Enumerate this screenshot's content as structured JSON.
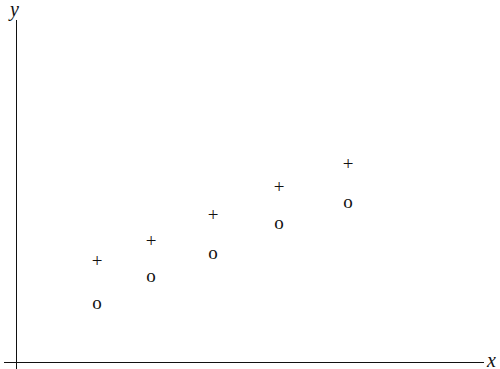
{
  "axes": {
    "x_label": "x",
    "y_label": "y"
  },
  "chart_data": {
    "type": "scatter",
    "title": "",
    "xlabel": "x",
    "ylabel": "y",
    "grid": false,
    "ticks": "none",
    "origin_px": [
      16,
      362
    ],
    "units_per_px": 0.1,
    "series": [
      {
        "name": "plus",
        "marker": "+",
        "x": [
          8.1,
          13.5,
          19.7,
          26.3,
          33.2
        ],
        "y": [
          10.1,
          12.1,
          14.7,
          17.5,
          19.8
        ]
      },
      {
        "name": "circle",
        "marker": "o",
        "x": [
          8.1,
          13.5,
          19.7,
          26.3,
          33.2
        ],
        "y": [
          5.9,
          8.6,
          10.9,
          13.9,
          16.0
        ]
      }
    ]
  }
}
